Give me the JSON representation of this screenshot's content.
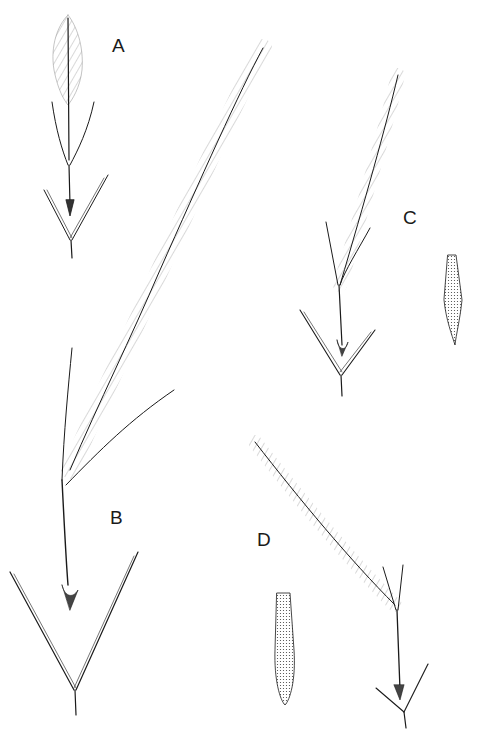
{
  "plate": {
    "background": "#ffffff",
    "ink_color": "#1a1a1a",
    "figures": [
      {
        "id": "A",
        "label": "A",
        "description": "small spikelet cluster with short plumose awn, two bract-like glumes"
      },
      {
        "id": "B",
        "label": "B",
        "description": "large spikelet with very long plumose awn and wide-spreading glumes"
      },
      {
        "id": "C",
        "label": "C",
        "description": "spikelet with plumose awn and detail of floret (callus)"
      },
      {
        "id": "D",
        "label": "D",
        "description": "spikelet with curved plumose awn and enlarged floret detail"
      }
    ]
  }
}
